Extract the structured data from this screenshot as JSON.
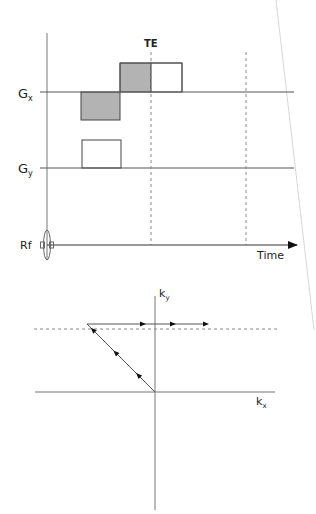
{
  "pulse_sequence": {
    "labels": {
      "gx": "G",
      "gx_sub": "x",
      "gy": "G",
      "gy_sub": "y",
      "rf": "Rf",
      "time": "Time",
      "te": "TE"
    },
    "colors": {
      "shaded_fill": "#b3b3b3",
      "open_fill": "#ffffff",
      "line": "#555555",
      "arrow": "#111111"
    },
    "gx_lobes": [
      {
        "name": "dephasing-lobe",
        "polarity": "negative",
        "shaded": true
      },
      {
        "name": "readout-lobe-pre-echo",
        "polarity": "positive",
        "shaded": true
      },
      {
        "name": "readout-lobe-post-echo",
        "polarity": "positive",
        "shaded": false
      }
    ],
    "gy_lobes": [
      {
        "name": "phase-encode-lobe",
        "polarity": "positive",
        "shaded": false
      }
    ]
  },
  "k_space": {
    "labels": {
      "kx": "k",
      "kx_sub": "x",
      "ky": "k",
      "ky_sub": "y"
    },
    "trajectory": [
      {
        "segment": "diagonal",
        "direction": "up-left",
        "arrows": 3
      },
      {
        "segment": "readout-line",
        "direction": "right",
        "arrows": 3
      }
    ]
  }
}
